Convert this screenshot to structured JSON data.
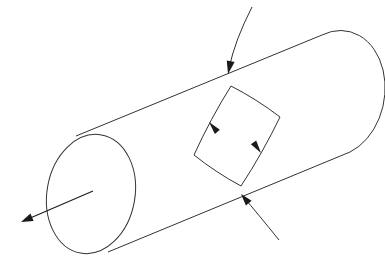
{
  "figure": {
    "title": "",
    "caption": "",
    "domain_kind": "line-drawing",
    "background_color": "#ffffff",
    "stroke_color": "#333333",
    "stroke_color_dark": "#1a1a1a",
    "stroke_width": 1.0,
    "canvas": {
      "width": 385,
      "height": 263
    }
  },
  "geometry": {
    "cylinder": {
      "name": "cylinder-body",
      "near_cap_ellipse": {
        "center_x": 91,
        "center_y": 194,
        "radius_x": 44,
        "radius_y": 60,
        "rotation_deg": 10,
        "note": "full ellipse, near (left) end cap of tube"
      },
      "far_cap_arc": {
        "start_x": 322,
        "start_y": 35,
        "end_x": 350,
        "end_y": 152,
        "radius_x": 46,
        "radius_y": 60,
        "rotation_deg": 10,
        "note": "only the right half of the far cap ellipse is visible"
      },
      "top_generator_line": {
        "x1": 76,
        "y1": 136,
        "x2": 322,
        "y2": 35
      },
      "bottom_generator_line": {
        "x1": 108,
        "y1": 252,
        "x2": 350,
        "y2": 152
      }
    },
    "axis_arrow": {
      "name": "cylinder-axis-arrow",
      "from_x": 93,
      "from_y": 191,
      "to_x": 21,
      "to_y": 222,
      "arrowhead": "solid-triangle",
      "note": "axis of the tube, arrow points out of the near cap toward lower-left"
    },
    "surface_patch": {
      "name": "oriented-surface-patch",
      "vertices": [
        {
          "label": "top",
          "x": 231,
          "y": 86
        },
        {
          "label": "right",
          "x": 280,
          "y": 117
        },
        {
          "label": "bottom",
          "x": 241,
          "y": 186
        },
        {
          "label": "left",
          "x": 194,
          "y": 155
        }
      ],
      "closed": true,
      "side_curvature": "slightly bowed outward",
      "orientation_arrows": [
        {
          "name": "patch-left-edge-arrow",
          "at_x": 209,
          "at_y": 122,
          "direction_deg": 230,
          "note": "on the top-left edge, pointing down-left"
        },
        {
          "name": "patch-right-edge-arrow",
          "at_x": 261,
          "at_y": 153,
          "direction_deg": 55,
          "note": "on the bottom-right edge, pointing up-right"
        }
      ]
    },
    "piercing_curve": {
      "name": "piercing-curve",
      "upper_segment": {
        "start_x": 252,
        "start_y": 7,
        "control_x": 235,
        "control_y": 40,
        "end_x": 228,
        "end_y": 73,
        "arrowhead_at": "end",
        "arrowhead_point": {
          "x": 228,
          "y": 74
        },
        "arrowhead_direction_deg": 255
      },
      "lower_segment": {
        "start_x": 241,
        "start_y": 194,
        "control_x": 258,
        "control_y": 214,
        "end_x": 279,
        "end_y": 240,
        "arrowhead_at": "start",
        "arrowhead_point": {
          "x": 241,
          "y": 194
        },
        "arrowhead_direction_deg": 218
      },
      "entry_point": {
        "x": 228,
        "y": 74,
        "note": "pierces top generator line"
      },
      "exit_point": {
        "x": 241,
        "y": 194,
        "note": "pierces bottom generator line"
      }
    }
  },
  "labels": {
    "visible_text_items": []
  }
}
